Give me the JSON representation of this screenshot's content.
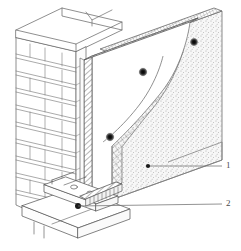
{
  "figure": {
    "background_color": "#ffffff",
    "line_color": "#585858",
    "width": 241,
    "height": 251
  },
  "callouts": [
    {
      "id": "1",
      "label": "1",
      "target": "render-coat-layer",
      "leader_dot": {
        "x": 148,
        "y": 166
      },
      "leader_end": {
        "x": 222,
        "y": 166
      }
    },
    {
      "id": "2",
      "label": "2",
      "target": "base-starter-track",
      "leader_dot": {
        "x": 78,
        "y": 206
      },
      "leader_end": {
        "x": 222,
        "y": 204
      }
    }
  ],
  "layers": [
    {
      "name": "masonry-brick-wall",
      "fill": "#ffffff",
      "stroke": "#6a6a6a"
    },
    {
      "name": "insulation-board",
      "fill": "#ffffff",
      "stroke": "#5a5a5a",
      "edge_pattern": "diagonal-hatch"
    },
    {
      "name": "reinforcing-mesh",
      "fill": "none",
      "stroke": "#707070",
      "pattern": "cross-grid"
    },
    {
      "name": "render-coat",
      "fill": "#f0f0f0",
      "stroke": "#6a6a6a",
      "pattern": "stipple"
    },
    {
      "name": "base-starter-track",
      "fill": "#ffffff",
      "stroke": "#5a5a5a"
    }
  ],
  "anchors": [
    {
      "name": "anchor-fastener",
      "x": 194,
      "y": 42,
      "r": 4.2
    },
    {
      "name": "anchor-fastener",
      "x": 143,
      "y": 72,
      "r": 4.4
    },
    {
      "name": "anchor-fastener",
      "x": 110,
      "y": 137,
      "r": 4.4
    },
    {
      "name": "anchor-fastener",
      "x": 78,
      "y": 206,
      "r": 3.0
    }
  ],
  "brick": {
    "course_count": 11,
    "note": "running bond courses shown in isometric projection"
  }
}
